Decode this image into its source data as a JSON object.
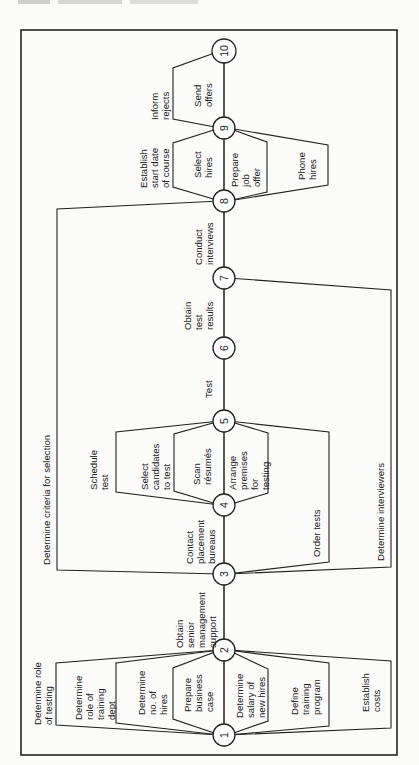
{
  "header": {
    "running_head": ""
  },
  "diagram": {
    "type": "activity-network (rotated 90°)",
    "nodes": [
      "1",
      "2",
      "3",
      "4",
      "5",
      "6",
      "7",
      "8",
      "9",
      "10"
    ],
    "activities": {
      "a1_2_determine_role_testing": "Determine role of testing",
      "a1_2_role_training_dept": "Determine role of training dept",
      "a1_2_no_hires": "Determine no. of hires",
      "a1_2_business_case": "Prepare business case",
      "a1_2_salary": "Determine salary of new hires",
      "a1_2_training_program": "Define training program",
      "a1_2_costs": "Establish costs",
      "a2_3": "Obtain senior management support",
      "a3_8_criteria": "Determine criteria for selection",
      "a3_4": "Contact placement bureaus",
      "a3_5_order_tests": "Order tests",
      "a3_7_interviewers": "Determine interviewers",
      "a4_5_schedule": "Schedule test",
      "a4_5_select": "Select candidates to test",
      "a4_5_scan": "Scan résumés",
      "a4_5_premises": "Arrange premises for testing",
      "a5_6": "Test",
      "a6_7": "Obtain test results",
      "a7_8": "Conduct interviews",
      "a8_9_start_date": "Establish start date of course",
      "a8_9_select_hires": "Select hires",
      "a8_9_job_offer": "Prepare job offer",
      "a8_9_phone": "Phone hires",
      "a9_10_inform": "Inform rejects",
      "a9_10_send": "Send offers"
    },
    "labels": {
      "l_role_testing": [
        "Determine role",
        "of testing"
      ],
      "l_role_training": [
        "Determine",
        "role of",
        "training",
        "dept"
      ],
      "l_no_hires": [
        "Determine",
        "no. of",
        "hires"
      ],
      "l_business": [
        "Prepare",
        "business",
        "case"
      ],
      "l_salary": [
        "Determine",
        "salary of",
        "new hires"
      ],
      "l_training_prog": [
        "Define",
        "training",
        "program"
      ],
      "l_costs": [
        "Establish",
        "costs"
      ],
      "l_senior": [
        "Obtain",
        "senior",
        "management",
        "support"
      ],
      "l_criteria": [
        "Determine criteria for selection"
      ],
      "l_contact": [
        "Contact",
        "placement",
        "bureaus"
      ],
      "l_order": [
        "Order tests"
      ],
      "l_interviewers": [
        "Determine interviewers"
      ],
      "l_schedule": [
        "Schedule",
        "test"
      ],
      "l_select_cand": [
        "Select",
        "candidates",
        "to test"
      ],
      "l_scan": [
        "Scan",
        "résumés"
      ],
      "l_premises": [
        "Arrange",
        "premises",
        "for",
        "testing"
      ],
      "l_test": [
        "Test"
      ],
      "l_results": [
        "Obtain",
        "test",
        "results"
      ],
      "l_conduct": [
        "Conduct",
        "interviews"
      ],
      "l_start_date": [
        "Establish",
        "start date",
        "of course"
      ],
      "l_select_hires": [
        "Select",
        "hires"
      ],
      "l_job_offer": [
        "Prepare",
        "job",
        "offer"
      ],
      "l_phone": [
        "Phone",
        "hires"
      ],
      "l_inform": [
        "Inform",
        "rejects"
      ],
      "l_send": [
        "Send",
        "offers"
      ]
    }
  }
}
